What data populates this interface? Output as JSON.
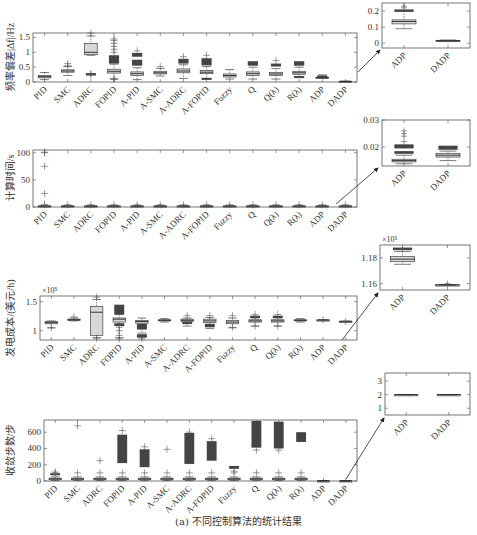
{
  "caption": "(a) 不同控制算法的统计结果",
  "chart_data": [
    {
      "type": "box",
      "id": "freq",
      "title": "",
      "ylabel": "频率偏差|Δf|/Hz",
      "categories": [
        "PID",
        "SMC",
        "ADRC",
        "FOPID",
        "A-PID",
        "A-SMC",
        "A-ADRC",
        "A-FOPID",
        "Fuzzy",
        "Q",
        "Q(λ)",
        "R(λ)",
        "ADP",
        "DADP"
      ],
      "ylim": [
        0,
        1.65
      ],
      "yticks": [
        0,
        0.5,
        1,
        1.5
      ],
      "ytick_labels": [
        "0",
        "0.5",
        "1",
        "1.5"
      ],
      "multiplier": "",
      "boxes": [
        {
          "min": 0.08,
          "q1": 0.14,
          "med": 0.18,
          "q3": 0.22,
          "max": 0.32,
          "outliers": [],
          "dense": []
        },
        {
          "min": 0.22,
          "q1": 0.33,
          "med": 0.37,
          "q3": 0.41,
          "max": 0.52,
          "outliers": [
            0.56,
            0.62
          ],
          "dense": []
        },
        {
          "min": 0.9,
          "q1": 0.92,
          "med": 1.0,
          "q3": 1.3,
          "max": 1.55,
          "outliers": [
            1.65,
            0.24,
            0.28
          ],
          "dense": [
            [
              0.22,
              0.3
            ]
          ]
        },
        {
          "min": 0.1,
          "q1": 0.3,
          "med": 0.36,
          "q3": 0.43,
          "max": 0.6,
          "outliers": [
            0.08,
            0.12,
            1.0,
            1.1,
            1.2,
            1.3,
            1.4,
            1.45
          ],
          "dense": [
            [
              0.62,
              0.9
            ]
          ]
        },
        {
          "min": 0.08,
          "q1": 0.22,
          "med": 0.28,
          "q3": 0.34,
          "max": 0.48,
          "outliers": [
            1.05
          ],
          "dense": [
            [
              0.55,
              0.75
            ],
            [
              0.85,
              0.98
            ]
          ]
        },
        {
          "min": 0.2,
          "q1": 0.27,
          "med": 0.31,
          "q3": 0.36,
          "max": 0.46,
          "outliers": [
            0.52
          ],
          "dense": []
        },
        {
          "min": 0.12,
          "q1": 0.31,
          "med": 0.37,
          "q3": 0.44,
          "max": 0.58,
          "outliers": [
            0.85
          ],
          "dense": [
            [
              0.62,
              0.78
            ]
          ]
        },
        {
          "min": 0.1,
          "q1": 0.28,
          "med": 0.33,
          "q3": 0.39,
          "max": 0.52,
          "outliers": [
            0.9
          ],
          "dense": [
            [
              0.56,
              0.8
            ],
            [
              0.08,
              0.14
            ]
          ]
        },
        {
          "min": 0.1,
          "q1": 0.17,
          "med": 0.22,
          "q3": 0.27,
          "max": 0.42,
          "outliers": [],
          "dense": []
        },
        {
          "min": 0.1,
          "q1": 0.22,
          "med": 0.28,
          "q3": 0.34,
          "max": 0.5,
          "outliers": [],
          "dense": [
            [
              0.55,
              0.7
            ]
          ]
        },
        {
          "min": 0.1,
          "q1": 0.22,
          "med": 0.27,
          "q3": 0.32,
          "max": 0.45,
          "outliers": [
            0.72
          ],
          "dense": [
            [
              0.52,
              0.62
            ]
          ]
        },
        {
          "min": 0.15,
          "q1": 0.26,
          "med": 0.31,
          "q3": 0.36,
          "max": 0.5,
          "outliers": [],
          "dense": [
            [
              0.55,
              0.7
            ],
            [
              0.16,
              0.2
            ]
          ]
        },
        {
          "min": 0.12,
          "q1": 0.14,
          "med": 0.15,
          "q3": 0.16,
          "max": 0.24,
          "outliers": [],
          "dense": [
            [
              0.19,
              0.22
            ]
          ]
        },
        {
          "min": 0.01,
          "q1": 0.015,
          "med": 0.02,
          "q3": 0.025,
          "max": 0.03,
          "outliers": [],
          "dense": []
        }
      ],
      "inset": {
        "categories": [
          "ADP",
          "DADP"
        ],
        "ylim": [
          -0.03,
          0.25
        ],
        "yticks": [
          0,
          0.1,
          0.2
        ],
        "ytick_labels": [
          "0",
          "0.1",
          "0.2"
        ],
        "boxes": [
          {
            "min": 0.09,
            "q1": 0.12,
            "med": 0.135,
            "q3": 0.145,
            "max": 0.2,
            "outliers": [
              0.22,
              0.23
            ],
            "dense": [
              [
                0.195,
                0.21
              ]
            ]
          },
          {
            "min": 0.01,
            "q1": 0.013,
            "med": 0.015,
            "q3": 0.017,
            "max": 0.02,
            "outliers": [],
            "dense": []
          }
        ]
      }
    },
    {
      "type": "box",
      "id": "time",
      "ylabel": "计算时间/s",
      "categories": [
        "PID",
        "SMC",
        "ADRC",
        "FOPID",
        "A-PID",
        "A-SMC",
        "A-ADRC",
        "A-FOPID",
        "Fuzzy",
        "Q",
        "Q(λ)",
        "R(λ)",
        "ADP",
        "DADP"
      ],
      "ylim": [
        0,
        105
      ],
      "yticks": [
        0,
        50,
        100
      ],
      "ytick_labels": [
        "0",
        "50",
        "100"
      ],
      "multiplier": "",
      "boxes": [
        {
          "min": 0.5,
          "q1": 1,
          "med": 1.5,
          "q3": 2,
          "max": 3,
          "outliers": [
            5,
            25,
            75,
            100,
            101
          ],
          "dense": []
        },
        {
          "min": 0.5,
          "q1": 1,
          "med": 1.5,
          "q3": 2,
          "max": 3,
          "outliers": [
            4
          ],
          "dense": []
        },
        {
          "min": 0.5,
          "q1": 1,
          "med": 1.5,
          "q3": 2,
          "max": 3,
          "outliers": [
            4
          ],
          "dense": []
        },
        {
          "min": 0.5,
          "q1": 1,
          "med": 1.5,
          "q3": 2,
          "max": 3,
          "outliers": [
            4
          ],
          "dense": []
        },
        {
          "min": 0.5,
          "q1": 1,
          "med": 1.5,
          "q3": 2,
          "max": 3,
          "outliers": [
            4
          ],
          "dense": []
        },
        {
          "min": 0.5,
          "q1": 1,
          "med": 1.5,
          "q3": 2,
          "max": 3,
          "outliers": [
            4
          ],
          "dense": []
        },
        {
          "min": 0.5,
          "q1": 1,
          "med": 1.5,
          "q3": 2,
          "max": 3,
          "outliers": [
            4
          ],
          "dense": []
        },
        {
          "min": 0.5,
          "q1": 1,
          "med": 1.5,
          "q3": 2,
          "max": 3,
          "outliers": [
            4
          ],
          "dense": []
        },
        {
          "min": 0.5,
          "q1": 1,
          "med": 1.5,
          "q3": 2,
          "max": 3,
          "outliers": [
            4
          ],
          "dense": []
        },
        {
          "min": 0.5,
          "q1": 1,
          "med": 1.5,
          "q3": 2,
          "max": 3,
          "outliers": [
            4
          ],
          "dense": []
        },
        {
          "min": 0.5,
          "q1": 1,
          "med": 1.5,
          "q3": 2,
          "max": 3,
          "outliers": [
            4
          ],
          "dense": []
        },
        {
          "min": 0.5,
          "q1": 1,
          "med": 1.5,
          "q3": 2,
          "max": 3,
          "outliers": [
            4
          ],
          "dense": []
        },
        {
          "min": 0.5,
          "q1": 1,
          "med": 1.5,
          "q3": 2,
          "max": 3,
          "outliers": [
            4
          ],
          "dense": []
        },
        {
          "min": 0.5,
          "q1": 1,
          "med": 1.5,
          "q3": 2,
          "max": 3,
          "outliers": [
            4
          ],
          "dense": []
        }
      ],
      "inset": {
        "categories": [
          "ADP",
          "DADP"
        ],
        "ylim": [
          0.013,
          0.03
        ],
        "yticks": [
          0.02,
          0.03
        ],
        "ytick_labels": [
          "0.02",
          "0.03"
        ],
        "boxes": [
          {
            "min": 0.0138,
            "q1": 0.0145,
            "med": 0.015,
            "q3": 0.0155,
            "max": 0.017,
            "outliers": [
              0.022,
              0.024,
              0.025,
              0.026
            ],
            "dense": [
              [
                0.0175,
                0.0185
              ],
              [
                0.0195,
                0.021
              ]
            ]
          },
          {
            "min": 0.015,
            "q1": 0.0163,
            "med": 0.017,
            "q3": 0.0177,
            "max": 0.0185,
            "outliers": [],
            "dense": [
              [
                0.019,
                0.0205
              ]
            ]
          }
        ]
      }
    },
    {
      "type": "box",
      "id": "cost",
      "ylabel": "发电成本/(美元/h)",
      "categories": [
        "PID",
        "SMC",
        "ADRC",
        "FOPID",
        "A-PID",
        "A-SMC",
        "A-ADRC",
        "A-FOPID",
        "Fuzzy",
        "Q",
        "Q(λ)",
        "R(λ)",
        "ADP",
        "DADP"
      ],
      "ylim": [
        0.84,
        1.6
      ],
      "yticks": [
        1,
        1.5
      ],
      "ytick_labels": [
        "1",
        "1.5"
      ],
      "multiplier": "×10⁵",
      "boxes": [
        {
          "min": 1.05,
          "q1": 1.12,
          "med": 1.14,
          "q3": 1.16,
          "max": 1.17,
          "outliers": [
            1.05
          ],
          "dense": []
        },
        {
          "min": 1.17,
          "q1": 1.18,
          "med": 1.19,
          "q3": 1.2,
          "max": 1.22,
          "outliers": [
            1.24
          ],
          "dense": []
        },
        {
          "min": 0.88,
          "q1": 0.92,
          "med": 1.32,
          "q3": 1.42,
          "max": 1.54,
          "outliers": [
            1.58,
            0.87
          ],
          "dense": []
        },
        {
          "min": 0.88,
          "q1": 1.15,
          "med": 1.2,
          "q3": 1.22,
          "max": 1.28,
          "outliers": [
            0.86,
            0.92,
            1.0,
            1.06
          ],
          "dense": [
            [
              1.28,
              1.45
            ],
            [
              1.08,
              1.13
            ]
          ]
        },
        {
          "min": 0.96,
          "q1": 1.13,
          "med": 1.16,
          "q3": 1.18,
          "max": 1.22,
          "outliers": [
            0.86
          ],
          "dense": [
            [
              1.02,
              1.12
            ],
            [
              0.88,
              0.94
            ]
          ]
        },
        {
          "min": 1.15,
          "q1": 1.17,
          "med": 1.18,
          "q3": 1.19,
          "max": 1.21,
          "outliers": [],
          "dense": []
        },
        {
          "min": 1.08,
          "q1": 1.16,
          "med": 1.18,
          "q3": 1.2,
          "max": 1.22,
          "outliers": [
            1.26
          ],
          "dense": [
            [
              1.12,
              1.15
            ]
          ]
        },
        {
          "min": 1.04,
          "q1": 1.14,
          "med": 1.17,
          "q3": 1.2,
          "max": 1.23,
          "outliers": [
            1.26
          ],
          "dense": [
            [
              1.06,
              1.12
            ]
          ]
        },
        {
          "min": 1.05,
          "q1": 1.12,
          "med": 1.15,
          "q3": 1.18,
          "max": 1.22,
          "outliers": [
            1.26,
            1.06
          ],
          "dense": []
        },
        {
          "min": 1.08,
          "q1": 1.15,
          "med": 1.17,
          "q3": 1.19,
          "max": 1.22,
          "outliers": [
            1.28,
            1.08
          ],
          "dense": [
            [
              1.22,
              1.26
            ]
          ]
        },
        {
          "min": 1.08,
          "q1": 1.15,
          "med": 1.17,
          "q3": 1.19,
          "max": 1.22,
          "outliers": [
            1.28,
            1.08
          ],
          "dense": [
            [
              1.22,
              1.26
            ]
          ]
        },
        {
          "min": 1.15,
          "q1": 1.17,
          "med": 1.18,
          "q3": 1.19,
          "max": 1.21,
          "outliers": [],
          "dense": []
        },
        {
          "min": 1.18,
          "q1": 1.183,
          "med": 1.185,
          "q3": 1.187,
          "max": 1.19,
          "outliers": [
            1.19
          ],
          "dense": []
        },
        {
          "min": 1.16,
          "q1": 1.162,
          "med": 1.163,
          "q3": 1.164,
          "max": 1.165,
          "outliers": [
            1.16
          ],
          "dense": []
        }
      ],
      "inset": {
        "categories": [
          "ADP",
          "DADP"
        ],
        "ylim": [
          1.155,
          1.19
        ],
        "yticks": [
          1.16,
          1.18
        ],
        "ytick_labels": [
          "1.16",
          "1.18"
        ],
        "multiplier": "×10⁵",
        "boxes": [
          {
            "min": 1.175,
            "q1": 1.177,
            "med": 1.179,
            "q3": 1.181,
            "max": 1.185,
            "outliers": [
              1.187
            ],
            "dense": [
              [
                1.186,
                1.188
              ]
            ]
          },
          {
            "min": 1.159,
            "q1": 1.159,
            "med": 1.159,
            "q3": 1.159,
            "max": 1.159,
            "outliers": [
              1.16
            ],
            "dense": []
          }
        ]
      }
    },
    {
      "type": "box",
      "id": "steps",
      "ylabel": "收敛步数/步",
      "categories": [
        "PID",
        "SMC",
        "ADRC",
        "FOPID",
        "A-PID",
        "A-SMC",
        "A-ADRC",
        "A-FOPID",
        "Fuzzy",
        "Q",
        "Q(λ)",
        "R(λ)",
        "ADP",
        "DADP"
      ],
      "ylim": [
        0,
        750
      ],
      "yticks": [
        0,
        200,
        400,
        600
      ],
      "ytick_labels": [
        "0",
        "200",
        "400",
        "600"
      ],
      "multiplier": "",
      "boxes": [
        {
          "min": 5,
          "q1": 15,
          "med": 25,
          "q3": 35,
          "max": 50,
          "outliers": [
            100,
            110
          ],
          "dense": [
            [
              70,
              95
            ]
          ]
        },
        {
          "min": 5,
          "q1": 15,
          "med": 25,
          "q3": 35,
          "max": 50,
          "outliers": [
            100,
            680
          ],
          "dense": []
        },
        {
          "min": 5,
          "q1": 15,
          "med": 25,
          "q3": 35,
          "max": 50,
          "outliers": [
            100,
            250
          ],
          "dense": []
        },
        {
          "min": 5,
          "q1": 15,
          "med": 25,
          "q3": 35,
          "max": 50,
          "outliers": [
            100,
            620
          ],
          "dense": [
            [
              220,
              570
            ]
          ]
        },
        {
          "min": 5,
          "q1": 15,
          "med": 25,
          "q3": 35,
          "max": 50,
          "outliers": [
            100,
            420
          ],
          "dense": [
            [
              170,
              390
            ]
          ]
        },
        {
          "min": 5,
          "q1": 15,
          "med": 25,
          "q3": 35,
          "max": 50,
          "outliers": [
            100,
            390
          ],
          "dense": []
        },
        {
          "min": 5,
          "q1": 15,
          "med": 25,
          "q3": 35,
          "max": 50,
          "outliers": [
            100,
            600
          ],
          "dense": [
            [
              210,
              590
            ]
          ]
        },
        {
          "min": 5,
          "q1": 15,
          "med": 25,
          "q3": 35,
          "max": 50,
          "outliers": [
            100,
            520
          ],
          "dense": [
            [
              250,
              490
            ]
          ]
        },
        {
          "min": 5,
          "q1": 15,
          "med": 25,
          "q3": 35,
          "max": 50,
          "outliers": [
            100,
            120
          ],
          "dense": [
            [
              150,
              185
            ]
          ]
        },
        {
          "min": 5,
          "q1": 15,
          "med": 25,
          "q3": 35,
          "max": 50,
          "outliers": [
            100,
            380
          ],
          "dense": [
            [
              410,
              740
            ]
          ]
        },
        {
          "min": 5,
          "q1": 15,
          "med": 25,
          "q3": 35,
          "max": 50,
          "outliers": [
            100,
            380
          ],
          "dense": [
            [
              400,
              730
            ]
          ]
        },
        {
          "min": 5,
          "q1": 15,
          "med": 25,
          "q3": 35,
          "max": 50,
          "outliers": [
            100
          ],
          "dense": [
            [
              480,
              600
            ]
          ]
        },
        {
          "min": 2,
          "q1": 2,
          "med": 2,
          "q3": 2,
          "max": 2,
          "outliers": [],
          "dense": []
        },
        {
          "min": 2,
          "q1": 2,
          "med": 2,
          "q3": 2,
          "max": 2,
          "outliers": [],
          "dense": []
        }
      ],
      "inset": {
        "categories": [
          "ADP",
          "DADP"
        ],
        "ylim": [
          0.5,
          3.6
        ],
        "yticks": [
          1,
          2,
          3
        ],
        "ytick_labels": [
          "1",
          "2",
          "3"
        ],
        "boxes": [
          {
            "min": 2,
            "q1": 2,
            "med": 2,
            "q3": 2,
            "max": 2,
            "outliers": [],
            "dense": []
          },
          {
            "min": 2,
            "q1": 2,
            "med": 2,
            "q3": 2,
            "max": 2,
            "outliers": [],
            "dense": []
          }
        ]
      }
    }
  ]
}
